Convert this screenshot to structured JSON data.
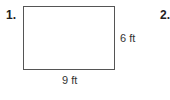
{
  "problems": [
    {
      "number": "1.",
      "figure": "rectangle",
      "labels": {
        "height": "6 ft",
        "width": "9 ft"
      }
    },
    {
      "number": "2."
    }
  ]
}
